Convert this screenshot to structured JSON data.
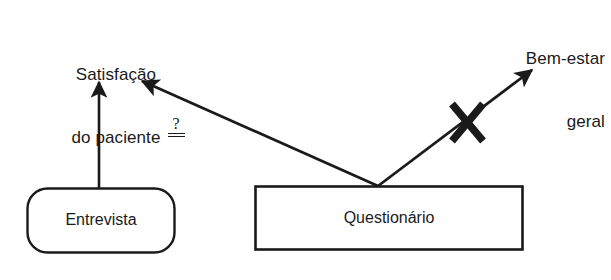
{
  "diagram": {
    "type": "path-diagram",
    "background_color": "#ffffff",
    "stroke_color": "#1a1a1a",
    "width": 611,
    "height": 280,
    "nodes": [
      {
        "id": "entrevista",
        "label": "Entrevista",
        "shape": "rounded-rectangle",
        "role": "measurement-method",
        "x": 27,
        "y": 188,
        "w": 148,
        "h": 65
      },
      {
        "id": "questionario",
        "label": "Questionário",
        "shape": "rectangle",
        "role": "measurement-method",
        "x": 255,
        "y": 186,
        "w": 268,
        "h": 64
      },
      {
        "id": "satisfacao",
        "label_line1": "Satisfação",
        "label_line2": "do paciente",
        "shape": "text",
        "role": "outcome",
        "x": 46,
        "y": 22
      },
      {
        "id": "bem_estar",
        "label_line1": "Bem-estar",
        "label_line2": "geral",
        "shape": "text",
        "role": "outcome",
        "x": 455,
        "y": 6
      }
    ],
    "edges": [
      {
        "id": "entrevista-to-satisfacao",
        "from": "entrevista",
        "to": "satisfacao",
        "style": "solid-arrow",
        "crossed_out": false
      },
      {
        "id": "questionario-to-satisfacao",
        "from": "questionario",
        "to": "satisfacao",
        "style": "solid-arrow",
        "crossed_out": false
      },
      {
        "id": "questionario-to-bem-estar",
        "from": "questionario",
        "to": "bem_estar",
        "style": "solid-arrow",
        "crossed_out": true,
        "cross_mark": "X"
      }
    ],
    "annotations": [
      {
        "id": "equivalence-question",
        "symbol": "?",
        "under_rule": "double",
        "meaning": "questioned-equivalence",
        "x": 163,
        "y": 116
      }
    ]
  }
}
